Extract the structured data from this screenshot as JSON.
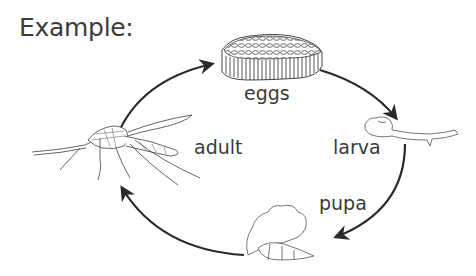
{
  "title": "Example:",
  "diagram": {
    "type": "life-cycle",
    "stages": [
      {
        "id": "eggs",
        "label": "eggs"
      },
      {
        "id": "larva",
        "label": "larva"
      },
      {
        "id": "pupa",
        "label": "pupa"
      },
      {
        "id": "adult",
        "label": "adult"
      }
    ],
    "edges": [
      {
        "from": "adult",
        "to": "eggs"
      },
      {
        "from": "eggs",
        "to": "larva"
      },
      {
        "from": "larva",
        "to": "pupa"
      },
      {
        "from": "pupa",
        "to": "adult"
      }
    ],
    "colors": {
      "arrow": "#2a2a2a",
      "drawing": "#555555",
      "text": "#3a3a3a"
    }
  }
}
